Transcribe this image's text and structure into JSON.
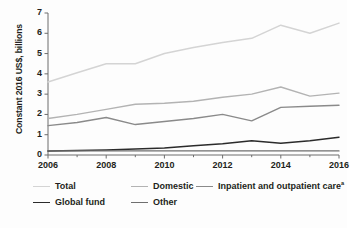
{
  "chart_data": {
    "type": "line",
    "title": "",
    "xlabel": "",
    "ylabel": "Constant 2016 US$, billions",
    "x": [
      2006,
      2007,
      2008,
      2009,
      2010,
      2011,
      2012,
      2013,
      2014,
      2015,
      2016
    ],
    "xtick_labels": [
      "2006",
      "2008",
      "2010",
      "2012",
      "2014",
      "2016"
    ],
    "xtick_values": [
      2006,
      2008,
      2010,
      2012,
      2014,
      2016
    ],
    "xlim": [
      2006,
      2016
    ],
    "ytick_labels": [
      "0",
      "1",
      "2",
      "3",
      "4",
      "5",
      "6",
      "7"
    ],
    "ytick_values": [
      0,
      1,
      2,
      3,
      4,
      5,
      6,
      7
    ],
    "ylim": [
      0,
      7
    ],
    "grid": false,
    "legend_position": "bottom",
    "series": [
      {
        "name": "Total",
        "color": "#d4d4d4",
        "width": 1.5,
        "values": [
          3.6,
          4.05,
          4.5,
          4.5,
          5.0,
          5.3,
          5.55,
          5.75,
          6.4,
          6.0,
          6.5
        ]
      },
      {
        "name": "Domestic",
        "color": "#b3b3b3",
        "width": 1.4,
        "values": [
          1.8,
          2.0,
          2.25,
          2.5,
          2.55,
          2.65,
          2.85,
          3.0,
          3.35,
          2.9,
          3.05
        ]
      },
      {
        "name": "Inpatient and outpatient care",
        "superscript": "a",
        "color": "#8a8a8a",
        "width": 1.4,
        "values": [
          1.45,
          1.6,
          1.85,
          1.5,
          1.65,
          1.8,
          2.0,
          1.68,
          2.35,
          2.4,
          2.45
        ]
      },
      {
        "name": "Global fund",
        "color": "#2b2b2b",
        "width": 1.5,
        "values": [
          0.2,
          0.22,
          0.25,
          0.3,
          0.35,
          0.45,
          0.55,
          0.7,
          0.58,
          0.7,
          0.88
        ]
      },
      {
        "name": "Other",
        "color": "#6f6f6f",
        "width": 1.3,
        "values": [
          0.2,
          0.2,
          0.2,
          0.2,
          0.2,
          0.2,
          0.2,
          0.2,
          0.2,
          0.2,
          0.2
        ]
      }
    ]
  },
  "axis": {
    "color": "#6d6d6d",
    "y_title": "Constant 2016 US$, billions"
  },
  "legend": {
    "entries": [
      {
        "label": "Total",
        "color": "#d4d4d4",
        "width": 1.6,
        "x": 33,
        "y": 0
      },
      {
        "label": "Domestic",
        "color": "#b3b3b3",
        "width": 1.5,
        "x": 131,
        "y": 0
      },
      {
        "label": "Inpatient and outpatient care",
        "superscript": "a",
        "color": "#8a8a8a",
        "width": 1.5,
        "x": 196,
        "y": 0
      },
      {
        "label": "Global fund",
        "color": "#2b2b2b",
        "width": 1.8,
        "x": 33,
        "y": 16
      },
      {
        "label": "Other",
        "color": "#6f6f6f",
        "width": 1.8,
        "x": 131,
        "y": 16
      }
    ]
  }
}
